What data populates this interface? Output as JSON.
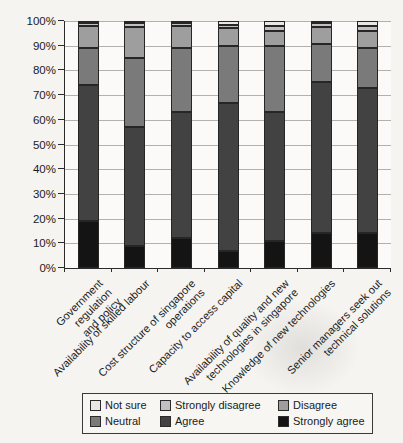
{
  "chart_data": {
    "type": "bar",
    "stacked": true,
    "title": "",
    "xlabel": "",
    "ylabel": "",
    "categories": [
      "Government regulation\nand policy",
      "Availability of skilled labour",
      "Cost structure of singapore\noperations",
      "Capacity to access capital",
      "Availability of quality and new\ntechnologies in singapore",
      "Knowledge of new technologies",
      "Senior managers seek out\ntechnical solutions"
    ],
    "series": [
      {
        "name": "Strongly agree",
        "color": "#141414",
        "values": [
          19,
          9,
          12,
          7,
          11,
          14,
          14
        ]
      },
      {
        "name": "Agree",
        "color": "#424242",
        "values": [
          55,
          48,
          51,
          60,
          52,
          61.5,
          59
        ]
      },
      {
        "name": "Neutral",
        "color": "#7a7a7a",
        "values": [
          15,
          28,
          26,
          23,
          27,
          15,
          16
        ]
      },
      {
        "name": "Disagree",
        "color": "#9e9e9e",
        "values": [
          9,
          12.5,
          9,
          7,
          6,
          7,
          7
        ]
      },
      {
        "name": "Strongly disagree",
        "color": "#c1c1c1",
        "values": [
          1,
          1.5,
          1,
          1.5,
          2,
          1.5,
          2
        ]
      },
      {
        "name": "Not sure",
        "color": "#e8e7e4",
        "values": [
          1,
          1,
          1,
          1.5,
          2,
          1,
          2
        ]
      }
    ],
    "ylim": [
      0,
      100
    ],
    "yticks": [
      "0%",
      "10%",
      "20%",
      "30%",
      "40%",
      "50%",
      "60%",
      "70%",
      "80%",
      "90%",
      "100%"
    ],
    "grid": "horizontal",
    "legend": {
      "position": "bottom",
      "entries": [
        "Not sure",
        "Strongly disagree",
        "Disagree",
        "Neutral",
        "Agree",
        "Strongly agree"
      ]
    }
  },
  "style": {
    "axis_color": "#2b2b2b",
    "grid_color": "#b3b1ad",
    "segment_border": "#262626",
    "text_color": "#1b1b1b",
    "page_bg": "#f5f4f1",
    "plot_bg": "#fbfaf8"
  }
}
